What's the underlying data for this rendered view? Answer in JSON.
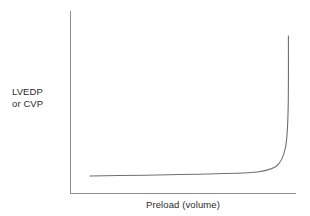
{
  "chart_data": {
    "type": "line",
    "title": "",
    "subtitle": "",
    "xlabel": "Preload (volume)",
    "ylabel_lines": [
      "LVEDP",
      "or CVP"
    ],
    "ylabel": "LVEDP or CVP",
    "legend": [],
    "legend_position": "none",
    "grid": false,
    "axis_ticks": false,
    "tick_labels_x": [],
    "tick_labels_y": [],
    "xlim": [
      0,
      1
    ],
    "ylim": [
      0,
      1
    ],
    "annotations": [],
    "series": [
      {
        "name": "ventricular compliance curve",
        "description": "Exponential pressure-volume compliance curve: flat at low volumes, rising steeply at high volumes",
        "x": [
          0.09,
          0.18,
          0.3,
          0.42,
          0.55,
          0.66,
          0.75,
          0.82,
          0.88,
          0.92,
          0.945,
          0.958,
          0.965,
          0.968
        ],
        "y": [
          0.108,
          0.11,
          0.113,
          0.118,
          0.125,
          0.136,
          0.152,
          0.18,
          0.24,
          0.34,
          0.47,
          0.62,
          0.78,
          0.9
        ]
      }
    ],
    "colors": {
      "curve": "#6e6e6e",
      "axis": "#8d8d8d",
      "text": "#2b2b2b",
      "background": "#ffffff"
    }
  },
  "geometry": {
    "axis_path": "M 70.5 11 L 70.5 193.5 L 296 193.5",
    "curve_path": "M 90 176 C 150 175.2, 210 174.4, 248 172.8 C 262 172.0, 270 170.4, 276 166.5 C 280.5 163.2, 283.6 157.0, 285.6 147.0 C 287.2 138.0, 288.0 122.0, 288.3 100.0 C 288.5 80.0, 288.5 55.0, 288.4 36.0"
  }
}
